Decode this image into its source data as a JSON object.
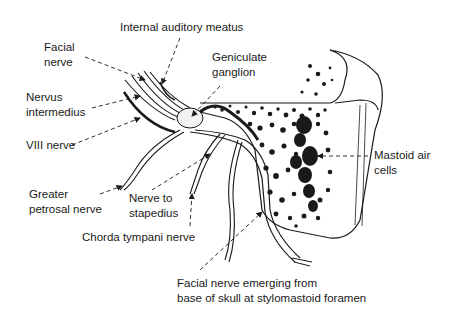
{
  "diagram": {
    "labels": {
      "internal_auditory_meatus": "Internal auditory meatus",
      "facial_nerve": "Facial\nnerve",
      "geniculate_ganglion": "Geniculate\nganglion",
      "nervus_intermedius": "Nervus\nintermedius",
      "viii_nerve": "VIII nerve",
      "mastoid_air_cells": "Mastoid air\ncells",
      "greater_petrosal_nerve": "Greater\npetrosal nerve",
      "nerve_to_stapedius": "Nerve to\nstapedius",
      "chorda_tympani_nerve": "Chorda tympani nerve",
      "facial_nerve_emerging": "Facial nerve emerging from\nbase of skull at stylomastoid foramen"
    },
    "colors": {
      "ink": "#1a1a1a",
      "background": "#ffffff"
    }
  }
}
